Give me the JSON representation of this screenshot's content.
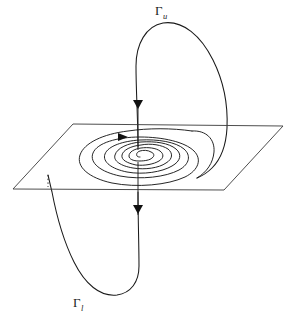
{
  "figure": {
    "background_color": "#ffffff",
    "stroke_color": "#1a1a1a",
    "width": 290,
    "height": 321,
    "labels": {
      "upper_orbit": {
        "symbol": "Γ",
        "subscript": "u",
        "x": 155,
        "y": 4
      },
      "lower_orbit": {
        "symbol": "Γ",
        "subscript": "l",
        "x": 73,
        "y": 296
      }
    },
    "plane": {
      "name": "invariant-plane",
      "shape": "parallelogram",
      "corners": "73,124 283,126 224,190 13,189",
      "stroke_color": "#3a3a3a"
    },
    "axis": {
      "name": "vertical-axis",
      "x": 138,
      "top_y": 100,
      "bottom_y": 215,
      "stroke_color": "#2a2a2a"
    },
    "spiral": {
      "name": "planar-spiral",
      "center_x": 139,
      "center_y": 157,
      "turns": 5.5,
      "outer_rx": 59,
      "outer_ry": 27,
      "direction": "inward"
    },
    "upper_loop": {
      "name": "upper-homoclinic-loop",
      "apex_x": 172,
      "apex_y": 25,
      "right_x": 227
    },
    "lower_loop": {
      "name": "lower-homoclinic-loop",
      "apex_x": 108,
      "apex_y": 293,
      "left_x": 48
    },
    "arrows": [
      {
        "name": "axis-arrow-upper",
        "x": 138,
        "y": 104,
        "direction": "down"
      },
      {
        "name": "axis-arrow-lower",
        "x": 138,
        "y": 209,
        "direction": "down"
      },
      {
        "name": "spiral-arrow",
        "x": 124,
        "y": 137,
        "direction": "right"
      }
    ],
    "hidden_segment": {
      "name": "occluded-curve-segment",
      "x": 48,
      "y_start": 175,
      "y_end": 187,
      "style": "dotted"
    }
  }
}
